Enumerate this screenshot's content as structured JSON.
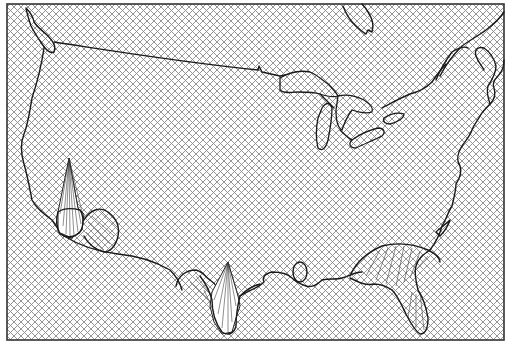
{
  "figure": {
    "type": "3d-surface-map",
    "region": "Contiguous United States",
    "background_pattern": "crosshatch",
    "colors": {
      "background": "#ffffff",
      "hatch": "#8a8a8a",
      "outline": "#1a1a1a",
      "frame": "#333333"
    },
    "frame": {
      "x": 7,
      "y": 4,
      "width": 497,
      "height": 336
    },
    "features": [
      {
        "name": "west-coast-coastline"
      },
      {
        "name": "northern-border-line"
      },
      {
        "name": "great-lakes"
      },
      {
        "name": "east-coast-coastline"
      },
      {
        "name": "gulf-coast-coastline"
      },
      {
        "name": "florida-peninsula"
      },
      {
        "name": "southern-california-peak"
      },
      {
        "name": "south-texas-peak"
      },
      {
        "name": "florida-surface-bulge"
      }
    ],
    "peaks": [
      {
        "name": "southern-california-peak",
        "x": 69,
        "y": 158
      },
      {
        "name": "south-texas-peak",
        "x": 228,
        "y": 262
      }
    ]
  }
}
